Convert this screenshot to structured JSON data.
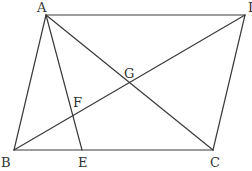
{
  "diagram": {
    "type": "geometry",
    "colors": {
      "line": "#3a3a3a",
      "label": "#333333",
      "background": "#ffffff"
    },
    "points": {
      "A": {
        "label": "A",
        "x": 46,
        "y": 15
      },
      "D": {
        "label": "D",
        "x": 245,
        "y": 15
      },
      "B": {
        "label": "B",
        "x": 14,
        "y": 150
      },
      "C": {
        "label": "C",
        "x": 213,
        "y": 150
      },
      "E": {
        "label": "E",
        "x": 82,
        "y": 150
      },
      "F": {
        "label": "F",
        "x": 73,
        "y": 116
      },
      "G": {
        "label": "G",
        "x": 129,
        "y": 83
      }
    },
    "segments": [
      {
        "name": "AD",
        "from": "A",
        "to": "D"
      },
      {
        "name": "AB",
        "from": "A",
        "to": "B"
      },
      {
        "name": "BC",
        "from": "B",
        "to": "C"
      },
      {
        "name": "CD",
        "from": "C",
        "to": "D"
      },
      {
        "name": "AC",
        "from": "A",
        "to": "C"
      },
      {
        "name": "BD",
        "from": "B",
        "to": "D"
      },
      {
        "name": "AE",
        "from": "A",
        "to": "E"
      }
    ],
    "labels": {
      "A": "A",
      "D": "D",
      "B": "B",
      "C": "C",
      "E": "E",
      "F": "F",
      "G": "G"
    }
  }
}
